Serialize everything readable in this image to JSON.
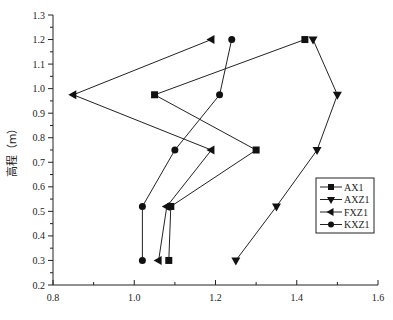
{
  "chart_data": {
    "type": "line",
    "title": "",
    "xlabel": "",
    "ylabel": "高程（m）",
    "xlim": [
      0.8,
      1.6
    ],
    "ylim": [
      0.2,
      1.3
    ],
    "xticks": [
      "0.8",
      "1.0",
      "1.2",
      "1.4",
      "1.6"
    ],
    "yticks": [
      "0.2",
      "0.3",
      "0.4",
      "0.5",
      "0.6",
      "0.7",
      "0.8",
      "0.9",
      "1.0",
      "1.1",
      "1.2",
      "1.3"
    ],
    "grid": false,
    "legend_position": "right-center",
    "series": [
      {
        "name": "AX1",
        "marker": "square",
        "points": [
          [
            1.085,
            0.3
          ],
          [
            1.09,
            0.52
          ],
          [
            1.3,
            0.75
          ],
          [
            1.05,
            0.975
          ],
          [
            1.42,
            1.2
          ]
        ]
      },
      {
        "name": "AXZ1",
        "marker": "triangle-down",
        "points": [
          [
            1.25,
            0.3
          ],
          [
            1.35,
            0.52
          ],
          [
            1.45,
            0.75
          ],
          [
            1.5,
            0.975
          ],
          [
            1.44,
            1.2
          ]
        ]
      },
      {
        "name": "FXZ1",
        "marker": "triangle-left",
        "points": [
          [
            1.06,
            0.3
          ],
          [
            1.08,
            0.52
          ],
          [
            1.19,
            0.75
          ],
          [
            0.85,
            0.975
          ],
          [
            1.19,
            1.2
          ]
        ]
      },
      {
        "name": "KXZ1",
        "marker": "circle",
        "points": [
          [
            1.02,
            0.3
          ],
          [
            1.02,
            0.52
          ],
          [
            1.1,
            0.75
          ],
          [
            1.21,
            0.975
          ],
          [
            1.24,
            1.2
          ]
        ]
      }
    ],
    "colors": {
      "line": "#222222",
      "marker": "#111111",
      "axis": "#222222"
    }
  }
}
